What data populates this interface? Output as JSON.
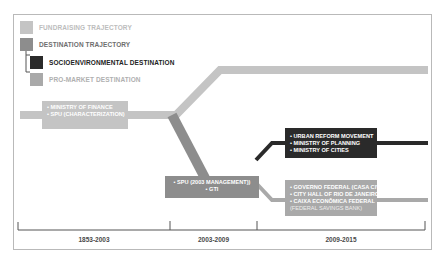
{
  "colors": {
    "fundraising": "#c4c4c4",
    "destination": "#8d8d8d",
    "socioenvironmental": "#2a2a2a",
    "pro_market": "#a9a9a9",
    "frame": "#b9b9b9",
    "timeline": "#555555"
  },
  "legend": [
    {
      "label": "FUNDRAISING TRAJECTORY",
      "swatch": "fundraising"
    },
    {
      "label": "DESTINATION TRAJECTORY",
      "swatch": "destination"
    },
    {
      "label": "SOCIOENVIRONMENTAL DESTINATION",
      "swatch": "socioenvironmental"
    },
    {
      "label": "PRO-MARKET DESTINATION",
      "swatch": "pro_market"
    }
  ],
  "nodes": {
    "finance": {
      "lines": [
        "• MINISTRY OF FINANCE",
        "• SPU (CHARACTERIZATION)"
      ]
    },
    "spu": {
      "lines": [
        "• SPU (2003 MANAGEMENT))",
        "• GTI"
      ]
    },
    "socioenvironmental": {
      "lines": [
        "• URBAN REFORM MOVEMENT",
        "• MINISTRY OF PLANNING",
        "• MINISTRY OF CITIES"
      ]
    },
    "pro_market": {
      "lines": [
        "• GOVERNO FEDERAL (CASA CIVIL)",
        "• CITY HALL OF RIO DE JANEIRO",
        "• CAIXA ECONÔMICA FEDERAL"
      ],
      "subline": "(FEDERAL SAVINGS BANK)"
    }
  },
  "timeline": {
    "periods": [
      "1853-2003",
      "2003-2009",
      "2009-2015"
    ]
  }
}
